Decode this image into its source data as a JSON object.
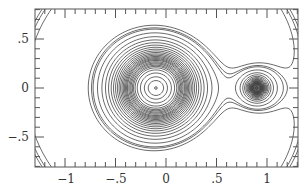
{
  "chart_data": {
    "type": "contour",
    "title": "",
    "xlabel": "",
    "ylabel": "",
    "xlim": [
      -1.3,
      1.3
    ],
    "ylim": [
      -0.8,
      0.8
    ],
    "grid": false,
    "legend": null,
    "x_ticks": [
      {
        "value": -1,
        "label": "−1"
      },
      {
        "value": -0.5,
        "label": "−.5"
      },
      {
        "value": 0,
        "label": "0"
      },
      {
        "value": 0.5,
        "label": ".5"
      },
      {
        "value": 1,
        "label": "1"
      }
    ],
    "y_ticks": [
      {
        "value": 0.5,
        "label": ".5"
      },
      {
        "value": 0,
        "label": "0"
      },
      {
        "value": -0.5,
        "label": "−.5"
      }
    ],
    "minor_tick_step": 0.1,
    "mass_ratio_mu": 0.1,
    "bodies": [
      {
        "name": "primary",
        "x": -0.1,
        "y": 0
      },
      {
        "name": "secondary",
        "x": 0.9,
        "y": 0
      }
    ],
    "levels": [
      1.7,
      1.745,
      1.77,
      1.85,
      1.95,
      2.05,
      2.15,
      2.25,
      2.35,
      2.45,
      2.55,
      2.65,
      2.75,
      2.85,
      2.95,
      3.05,
      3.15,
      3.25,
      3.35,
      3.5,
      3.65,
      3.8,
      4.0,
      4.2,
      4.5,
      5.0,
      6.0,
      8.0,
      12.0
    ],
    "colors": {
      "line": "#444444",
      "frame": "#555555",
      "background": "#ffffff"
    }
  }
}
